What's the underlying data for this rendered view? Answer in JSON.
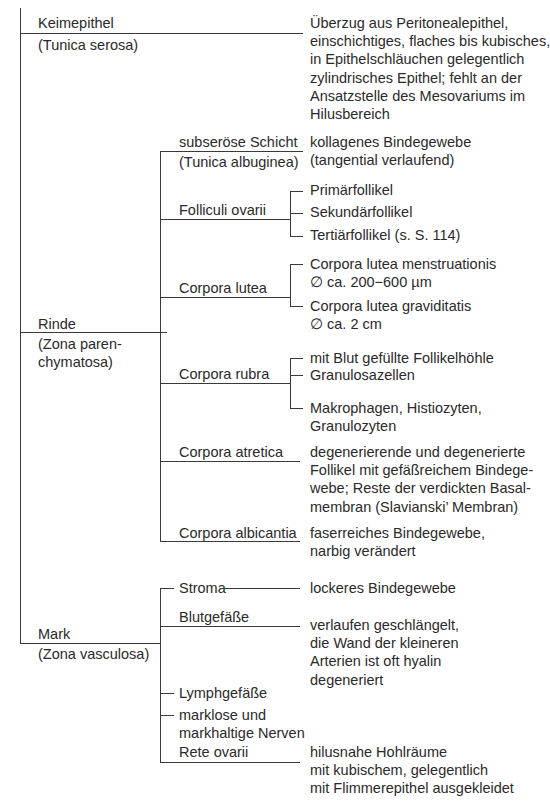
{
  "root": {
    "keimepithel": {
      "label": "Keimepithel",
      "sub": "(Tunica serosa)",
      "desc": [
        "Überzug aus Peritonealepithel,",
        "einschichtiges, flaches bis kubisches,",
        "in Epithelschläuchen gelegentlich",
        "zylindrisches Epithel; fehlt an der",
        "Ansatzstelle des Mesovariums im",
        "Hilusbereich"
      ]
    },
    "rinde": {
      "label": "Rinde",
      "sub1": "(Zona paren-",
      "sub2": "chymatosa)",
      "children": {
        "subseroese": {
          "label": "subseröse Schicht",
          "sub": "(Tunica albuginea)",
          "desc": [
            "kollagenes Bindegewebe",
            "(tangential verlaufend)"
          ]
        },
        "folliculi": {
          "label": "Folliculi ovarii",
          "items": [
            "Primärfollikel",
            "Sekundärfollikel",
            "Tertiärfollikel (s. S. 114)"
          ]
        },
        "lutea": {
          "label": "Corpora lutea",
          "items": [
            [
              "Corpora lutea menstruationis",
              "∅ ca. 200−600 µm"
            ],
            [
              "Corpora lutea graviditatis",
              "∅ ca. 2 cm"
            ]
          ]
        },
        "rubra": {
          "label": "Corpora rubra",
          "items": [
            "mit Blut gefüllte Follikelhöhle",
            "Granulosazellen",
            [
              "Makrophagen, Histiozyten,",
              "Granulozyten"
            ]
          ]
        },
        "atretica": {
          "label": "Corpora atretica",
          "desc": [
            "degenerierende und degenerierte",
            "Follikel mit gefäßreichem Bindege-",
            "webe; Reste der verdickten Basal-",
            "membran (Slavianski’ Membran)"
          ]
        },
        "albicantia": {
          "label": "Corpora albicantia",
          "desc": [
            "faserreiches Bindegewebe,",
            "narbig verändert"
          ]
        }
      }
    },
    "mark": {
      "label": "Mark",
      "sub": "(Zona vasculosa)",
      "children": {
        "stroma": {
          "label": "Stroma",
          "desc": "lockeres Bindegewebe"
        },
        "blut": {
          "label": "Blutgefäße",
          "desc": [
            "verlaufen geschlängelt,",
            "die Wand der kleineren",
            "Arterien ist oft hyalin",
            "degeneriert"
          ]
        },
        "lymph": {
          "label": "Lymphgefäße"
        },
        "nerven": {
          "label1": "marklose und",
          "label2": "markhaltige Nerven"
        },
        "rete": {
          "label": "Rete ovarii",
          "desc": [
            "hilusnahe Hohlräume",
            "mit kubischem, gelegentlich",
            "mit Flimmerepithel ausgekleidet"
          ]
        }
      }
    }
  }
}
